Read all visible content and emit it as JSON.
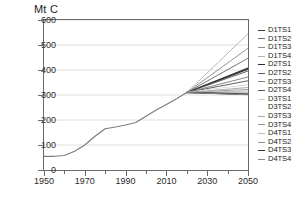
{
  "chart_data": {
    "type": "line",
    "title": "Mt C",
    "xlabel": "",
    "ylabel": "Mt C",
    "xlim": [
      1950,
      2050
    ],
    "ylim": [
      0,
      600
    ],
    "ytick_values": [
      0,
      100,
      200,
      300,
      400,
      500,
      600
    ],
    "ytick_labels": [
      "0",
      "100",
      "200",
      "300",
      "400",
      "500",
      "600"
    ],
    "xtick_values": [
      1950,
      1970,
      1990,
      2010,
      2030,
      2050
    ],
    "xtick_labels": [
      "1950",
      "1970",
      "1990",
      "2010",
      "2030",
      "2050"
    ],
    "xminor_values": [
      1960,
      1980,
      2000,
      2020,
      2040
    ],
    "grid": "horizontal",
    "legend_position": "right",
    "history": {
      "name": "historical",
      "x": [
        1950,
        1955,
        1960,
        1965,
        1970,
        1975,
        1980,
        1985,
        1990,
        1995,
        2000,
        2005,
        2010,
        2015,
        2020
      ],
      "y": [
        55,
        55,
        58,
        75,
        100,
        135,
        165,
        172,
        180,
        190,
        215,
        240,
        262,
        285,
        310
      ]
    },
    "series": [
      {
        "name": "D1TS1",
        "color": "#3a3a3a",
        "x": [
          2020,
          2050
        ],
        "y": [
          310,
          408
        ]
      },
      {
        "name": "D1TS2",
        "color": "#6e6e6e",
        "x": [
          2020,
          2050
        ],
        "y": [
          310,
          447
        ]
      },
      {
        "name": "D1TS3",
        "color": "#8c8c8c",
        "x": [
          2020,
          2050
        ],
        "y": [
          310,
          487
        ]
      },
      {
        "name": "D1TS4",
        "color": "#b4b4b4",
        "x": [
          2020,
          2050
        ],
        "y": [
          310,
          545
        ]
      },
      {
        "name": "D2TS1",
        "color": "#2e2e2e",
        "x": [
          2020,
          2050
        ],
        "y": [
          310,
          404
        ]
      },
      {
        "name": "D2TS2",
        "color": "#5a5a5a",
        "x": [
          2020,
          2050
        ],
        "y": [
          310,
          396
        ]
      },
      {
        "name": "D2TS3",
        "color": "#7e7e7e",
        "x": [
          2020,
          2050
        ],
        "y": [
          310,
          372
        ]
      },
      {
        "name": "D2TS4",
        "color": "#555555",
        "x": [
          2020,
          2050
        ],
        "y": [
          310,
          357
        ]
      },
      {
        "name": "D3TS1",
        "color": "#cdcdcd",
        "x": [
          2020,
          2050
        ],
        "y": [
          310,
          341
        ]
      },
      {
        "name": "D3TS2",
        "color": "#ffffff",
        "x": [
          2020,
          2050
        ],
        "y": [
          310,
          336
        ]
      },
      {
        "name": "D3TS3",
        "color": "#a8a8a8",
        "x": [
          2020,
          2050
        ],
        "y": [
          310,
          330
        ]
      },
      {
        "name": "D3TS4",
        "color": "#9a9a9a",
        "x": [
          2020,
          2050
        ],
        "y": [
          310,
          322
        ]
      },
      {
        "name": "D4TS1",
        "color": "#bdbdbd",
        "x": [
          2020,
          2050
        ],
        "y": [
          310,
          316
        ]
      },
      {
        "name": "D4TS2",
        "color": "#909090",
        "x": [
          2020,
          2050
        ],
        "y": [
          310,
          308
        ]
      },
      {
        "name": "D4TS3",
        "color": "#333333",
        "x": [
          2020,
          2050
        ],
        "y": [
          310,
          303
        ]
      },
      {
        "name": "D4TS4",
        "color": "#8a8a8a",
        "x": [
          2020,
          2050
        ],
        "y": [
          310,
          301
        ]
      }
    ]
  },
  "colors": {
    "axis": "#6a6a6a",
    "grid": "#d8d8d8",
    "history_line": "#7d7d7d",
    "text": "#1b1b1b",
    "background": "#ffffff"
  }
}
